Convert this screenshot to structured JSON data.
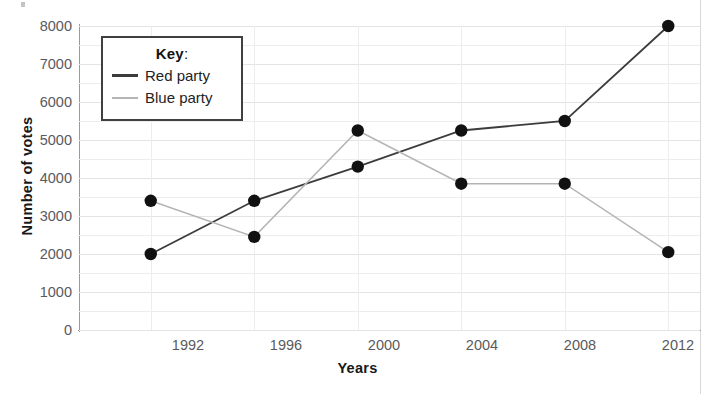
{
  "chart_data": {
    "type": "line",
    "title": "",
    "xlabel": "Years",
    "ylabel": "Number of votes",
    "categories": [
      "1992",
      "1996",
      "2000",
      "2004",
      "2008",
      "2012"
    ],
    "x": [
      1992,
      1996,
      2000,
      2004,
      2008,
      2012
    ],
    "series": [
      {
        "name": "Red party",
        "color": "#3c3c3c",
        "values": [
          2000,
          3400,
          4300,
          5250,
          5500,
          8000
        ]
      },
      {
        "name": "Blue party",
        "color": "#b4b4b4",
        "values": [
          3400,
          2450,
          5250,
          3850,
          3850,
          2050
        ]
      }
    ],
    "ylim": [
      0,
      8000
    ],
    "yticks": [
      0,
      1000,
      2000,
      3000,
      4000,
      5000,
      6000,
      7000,
      8000
    ],
    "ytick_labels": [
      "0",
      "1000",
      "2000",
      "3000",
      "4000",
      "5000",
      "6000",
      "7000",
      "8000"
    ],
    "minor_ytick_step": 500,
    "grid": true,
    "legend_position": "upper-left",
    "marker": "filled-circle",
    "marker_color": "#111111"
  },
  "legend": {
    "title": "Key",
    "title_suffix": ":",
    "entries": [
      {
        "label": "Red party",
        "swatch": "red"
      },
      {
        "label": "Blue party",
        "swatch": "blue"
      }
    ]
  },
  "axes": {
    "x_title": "Years",
    "y_title": "Number of votes"
  }
}
